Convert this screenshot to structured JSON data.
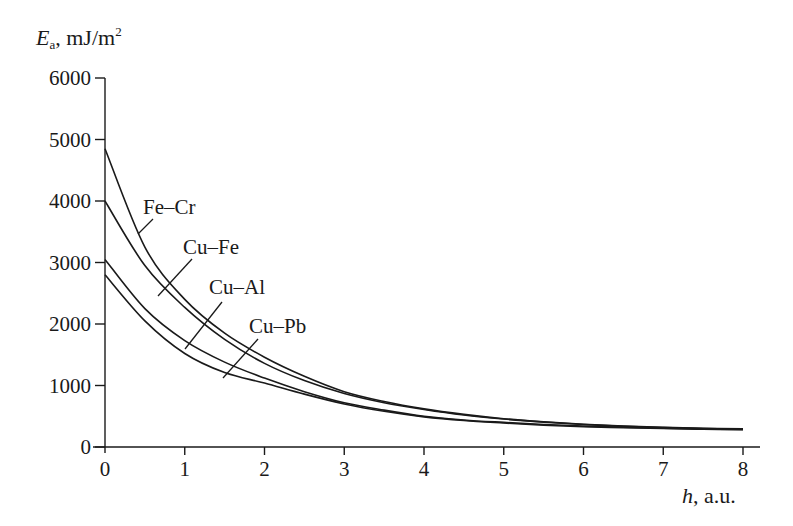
{
  "chart_data": {
    "type": "line",
    "title": "",
    "ylabel": {
      "symbol": "E",
      "subscript": "a",
      "unit": ", mJ/m",
      "unit_sup": "2"
    },
    "xlabel": {
      "symbol": "h",
      "unit": ", a.u."
    },
    "xlim": [
      0,
      8
    ],
    "ylim": [
      0,
      6000
    ],
    "xticks": [
      0,
      1,
      2,
      3,
      4,
      5,
      6,
      7,
      8
    ],
    "yticks": [
      0,
      1000,
      2000,
      3000,
      4000,
      5000,
      6000
    ],
    "grid": false,
    "legend": "inline labels with leader lines",
    "x": [
      0,
      0.5,
      1,
      1.5,
      2,
      2.5,
      3,
      3.5,
      4,
      4.5,
      5,
      5.5,
      6,
      6.5,
      7,
      7.5,
      8
    ],
    "series": [
      {
        "name": "Fe–Cr",
        "values": [
          4850,
          3250,
          2400,
          1850,
          1460,
          1150,
          900,
          740,
          620,
          530,
          460,
          410,
          370,
          340,
          320,
          305,
          295
        ]
      },
      {
        "name": "Cu–Fe",
        "values": [
          4000,
          2950,
          2270,
          1750,
          1360,
          1080,
          870,
          720,
          610,
          520,
          455,
          405,
          365,
          335,
          315,
          300,
          290
        ]
      },
      {
        "name": "Cu–Al",
        "values": [
          3050,
          2250,
          1730,
          1380,
          1120,
          900,
          720,
          600,
          500,
          440,
          400,
          365,
          340,
          320,
          305,
          295,
          285
        ]
      },
      {
        "name": "Cu–Pb",
        "values": [
          2800,
          2050,
          1520,
          1210,
          1040,
          860,
          700,
          580,
          490,
          430,
          390,
          355,
          330,
          315,
          300,
          290,
          282
        ]
      }
    ],
    "annotations": [
      {
        "text": "Fe–Cr",
        "label_x": 143,
        "label_y": 214,
        "leader": [
          153,
          219,
          138,
          234
        ]
      },
      {
        "text": "Cu–Fe",
        "label_x": 183,
        "label_y": 254,
        "leader": [
          192,
          259,
          158,
          296
        ]
      },
      {
        "text": "Cu–Al",
        "label_x": 209,
        "label_y": 294,
        "leader": [
          222,
          302,
          185,
          349
        ]
      },
      {
        "text": "Cu–Pb",
        "label_x": 249,
        "label_y": 333,
        "leader": [
          258,
          339,
          223,
          378
        ]
      }
    ],
    "colors": {
      "line": "#1a1a1a",
      "background": "#ffffff"
    }
  }
}
